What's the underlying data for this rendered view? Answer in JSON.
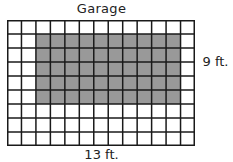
{
  "diagram": {
    "title": "Garage",
    "width_label": "13 ft.",
    "height_label": "9 ft.",
    "grid": {
      "columns": 13,
      "rows": 9,
      "cell_fill": "#ffffff",
      "line_color": "#1a1a1a",
      "shaded_fill": "#999999",
      "shaded_region": {
        "col_start": 2,
        "col_end": 11,
        "row_start": 1,
        "row_end": 5,
        "width_cells": 10,
        "height_cells": 5
      }
    }
  }
}
